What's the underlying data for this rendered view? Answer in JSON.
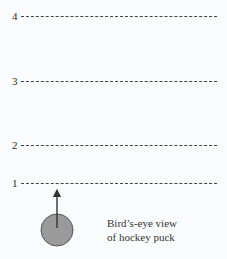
{
  "lines": [
    {
      "label": "4",
      "y": 16
    },
    {
      "label": "3",
      "y": 81
    },
    {
      "label": "2",
      "y": 145
    },
    {
      "label": "1",
      "y": 183
    }
  ],
  "puck": {
    "cx": 57,
    "cy": 230,
    "r": 16,
    "fill": "#9a9a9a",
    "stroke": "#555555"
  },
  "arrow": {
    "x": 57,
    "y1": 220,
    "y2": 190,
    "color": "#333333"
  },
  "caption": {
    "line1": "Bird’s-eye view",
    "line2": "of hockey puck"
  }
}
